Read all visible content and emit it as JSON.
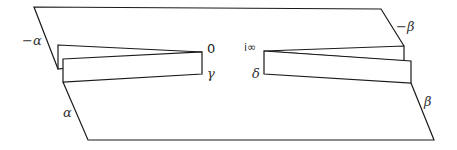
{
  "diagram": {
    "stroke_color": "#1a1a1a",
    "background": "#ffffff",
    "labels": {
      "minus_alpha": "−α",
      "alpha": "α",
      "minus_beta": "−β",
      "beta": "β",
      "zero": "0",
      "gamma": "γ",
      "i_infinity": "i∞",
      "delta": "δ"
    },
    "vertices": {
      "outer_top_left": [
        34,
        7
      ],
      "outer_top_right": [
        381,
        9
      ],
      "outer_bottom_left": [
        88,
        140
      ],
      "outer_bottom_right": [
        434,
        140
      ],
      "cusp_zero": [
        202,
        52
      ],
      "cusp_i_infinity": [
        264,
        51
      ]
    }
  }
}
